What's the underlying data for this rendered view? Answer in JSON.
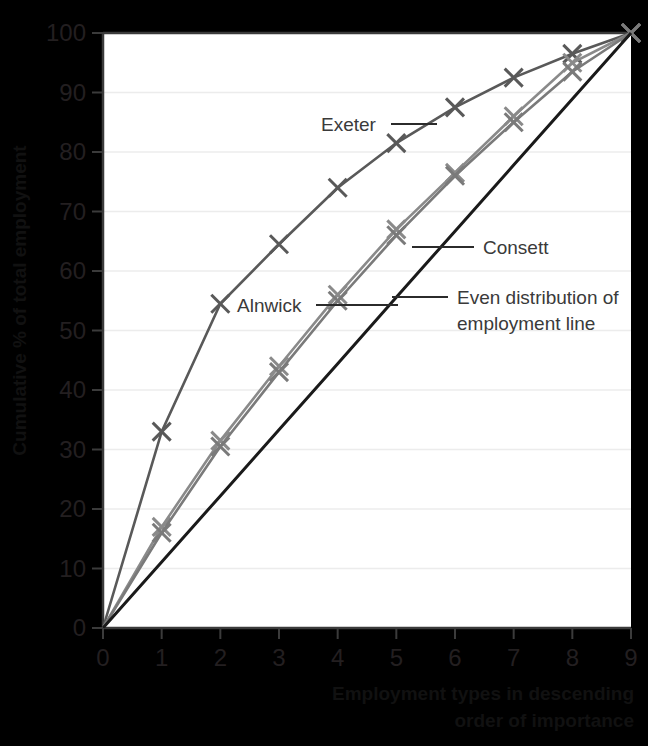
{
  "chart_data": {
    "type": "line",
    "title": "",
    "xlabel": "Employment types in descending order of importance",
    "ylabel": "Cumulative % of total employment",
    "xlim": [
      0,
      9
    ],
    "ylim": [
      0,
      100
    ],
    "xticks": [
      "0",
      "1",
      "2",
      "3",
      "4",
      "5",
      "6",
      "7",
      "8",
      "9"
    ],
    "yticks": [
      "0",
      "10",
      "20",
      "30",
      "40",
      "50",
      "60",
      "70",
      "80",
      "90",
      "100"
    ],
    "grid": true,
    "legend_position": "inline-annotations",
    "x": [
      0,
      1,
      2,
      3,
      4,
      5,
      6,
      7,
      8,
      9
    ],
    "series": [
      {
        "name": "Exeter",
        "color": "#595959",
        "marker": "x",
        "values": [
          0,
          33,
          54.5,
          64.5,
          74,
          81.5,
          87.5,
          92.5,
          96.5,
          100
        ]
      },
      {
        "name": "Consett",
        "color": "#8a8a8a",
        "marker": "x",
        "values": [
          0,
          17,
          31.5,
          44,
          56,
          67,
          76.5,
          86,
          95,
          100
        ]
      },
      {
        "name": "Alnwick",
        "color": "#7a7a7a",
        "marker": "x",
        "values": [
          0,
          16,
          30.5,
          43,
          55,
          66,
          76,
          85,
          93.5,
          100
        ]
      },
      {
        "name": "Even distribution of employment line",
        "color": "#1a1a1a",
        "marker": "none",
        "values": [
          0,
          11.1,
          22.2,
          33.3,
          44.4,
          55.6,
          66.7,
          77.8,
          88.9,
          100
        ]
      }
    ],
    "annotations": [
      {
        "label": "Exeter",
        "text_x": 321,
        "text_y": 131,
        "leader_x1": 391,
        "leader_y1": 124,
        "leader_x2": 437,
        "leader_y2": 124
      },
      {
        "label": "Alnwick",
        "text_x": 237,
        "text_y": 312,
        "leader_x1": 316,
        "leader_y1": 305,
        "leader_x2": 398,
        "leader_y2": 305
      },
      {
        "label": "Consett",
        "text_x": 483,
        "text_y": 254,
        "leader_x1": 412,
        "leader_y1": 247,
        "leader_x2": 474,
        "leader_y2": 247
      },
      {
        "label": "Even distribution of",
        "text_x": 457,
        "text_y": 304,
        "leader_x1": 392,
        "leader_y1": 297,
        "leader_x2": 448,
        "leader_y2": 297
      },
      {
        "label": "employment line",
        "text_x": 457,
        "text_y": 330,
        "leader_x1": 0,
        "leader_y1": 0,
        "leader_x2": 0,
        "leader_y2": 0
      }
    ],
    "colors": {
      "background": "#f2f2f0",
      "plot_area": "#ffffff",
      "axis": "#3b3b3b",
      "grid": "#ececec",
      "text": "#231f20"
    }
  }
}
